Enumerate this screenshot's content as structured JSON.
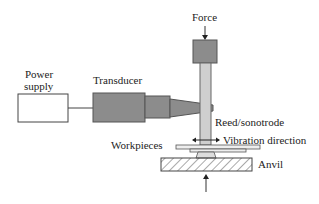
{
  "diagram": {
    "labels": {
      "power_supply_line1": "Power",
      "power_supply_line2": "supply",
      "transducer": "Transducer",
      "force": "Force",
      "reed": "Reed/sonotrode",
      "vibration": "Vibration direction",
      "workpieces": "Workpieces",
      "anvil": "Anvil"
    },
    "colors": {
      "transducer_fill": "#8c8c8c",
      "rod_fill": "#cfcfcf",
      "outline": "#444444",
      "hatch": "#555555"
    }
  }
}
